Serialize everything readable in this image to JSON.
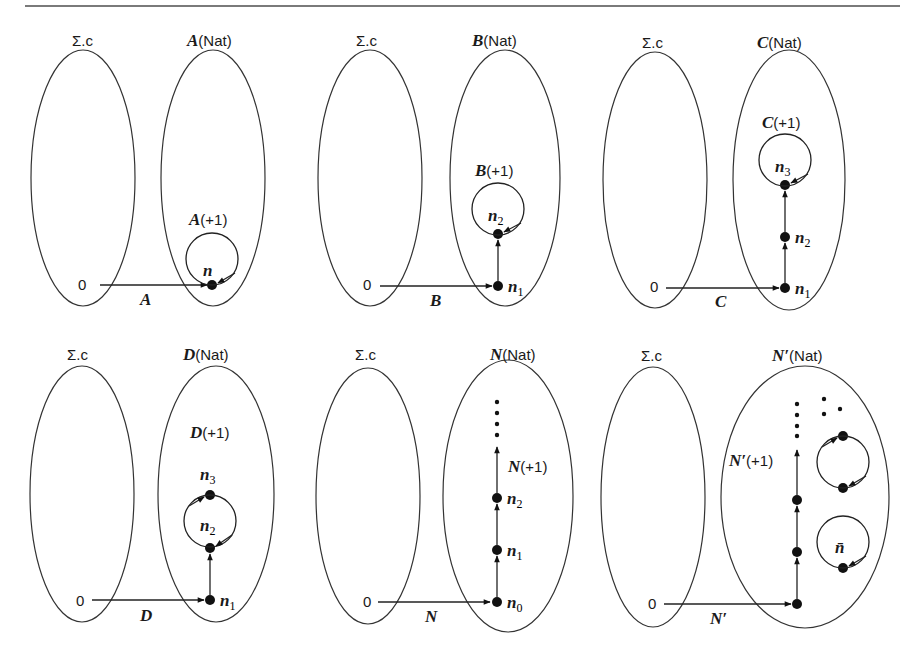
{
  "figure": {
    "panels": [
      {
        "id": "A",
        "source_label": "Σ.c",
        "target_label_fn": "A",
        "target_label_arg": "(Nat)",
        "zero_label": "0",
        "map_label": "A",
        "op_label_fn": "A",
        "op_label_arg": "(+1)",
        "nodes": [
          {
            "name": "n",
            "sub": ""
          }
        ]
      },
      {
        "id": "B",
        "source_label": "Σ.c",
        "target_label_fn": "B",
        "target_label_arg": "(Nat)",
        "zero_label": "0",
        "map_label": "B",
        "op_label_fn": "B",
        "op_label_arg": "(+1)",
        "nodes": [
          {
            "name": "n",
            "sub": "1"
          },
          {
            "name": "n",
            "sub": "2"
          }
        ]
      },
      {
        "id": "C",
        "source_label": "Σ.c",
        "target_label_fn": "C",
        "target_label_arg": "(Nat)",
        "zero_label": "0",
        "map_label": "C",
        "op_label_fn": "C",
        "op_label_arg": "(+1)",
        "nodes": [
          {
            "name": "n",
            "sub": "1"
          },
          {
            "name": "n",
            "sub": "2"
          },
          {
            "name": "n",
            "sub": "3"
          }
        ]
      },
      {
        "id": "D",
        "source_label": "Σ.c",
        "target_label_fn": "D",
        "target_label_arg": "(Nat)",
        "zero_label": "0",
        "map_label": "D",
        "op_label_fn": "D",
        "op_label_arg": "(+1)",
        "nodes": [
          {
            "name": "n",
            "sub": "1"
          },
          {
            "name": "n",
            "sub": "2"
          },
          {
            "name": "n",
            "sub": "3"
          }
        ]
      },
      {
        "id": "N",
        "source_label": "Σ.c",
        "target_label_fn": "N",
        "target_label_arg": "(Nat)",
        "zero_label": "0",
        "map_label": "N",
        "op_label_fn": "N",
        "op_label_arg": "(+1)",
        "nodes": [
          {
            "name": "n",
            "sub": "0"
          },
          {
            "name": "n",
            "sub": "1"
          },
          {
            "name": "n",
            "sub": "2"
          }
        ]
      },
      {
        "id": "N-prime",
        "source_label": "Σ.c",
        "target_label_fn": "N′",
        "target_label_arg": "(Nat)",
        "zero_label": "0",
        "map_label": "N′",
        "op_label_fn": "N′",
        "op_label_arg": "(+1)",
        "extra_node_label": "n̄"
      }
    ]
  }
}
